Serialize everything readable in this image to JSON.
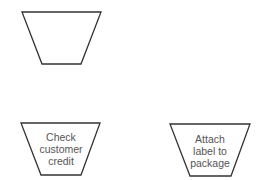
{
  "diagram": {
    "type": "flowchart-manual-operation-symbols",
    "shapes": [
      {
        "id": "blank",
        "label_lines": []
      },
      {
        "id": "check-credit",
        "label_lines": [
          "Check",
          "customer",
          "credit"
        ]
      },
      {
        "id": "attach-label",
        "label_lines": [
          "Attach",
          "label to",
          "package"
        ]
      }
    ]
  }
}
